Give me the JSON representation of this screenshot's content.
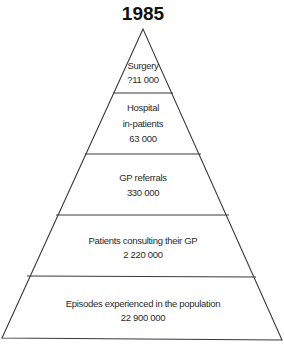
{
  "title": "1985",
  "pyramid": {
    "levels": [
      {
        "lines": [
          "Surgery",
          "?11 000"
        ],
        "label": "Surgery",
        "value": "?11 000"
      },
      {
        "lines": [
          "Hospital",
          "in-patients",
          "63 000"
        ],
        "label": "Hospital in-patients",
        "value": "63 000"
      },
      {
        "lines": [
          "GP referrals",
          "330 000"
        ],
        "label": "GP referrals",
        "value": "330 000"
      },
      {
        "lines": [
          "Patients consulting their GP",
          "2 220 000"
        ],
        "label": "Patients consulting their GP",
        "value": "2 220 000"
      },
      {
        "lines": [
          "Episodes experienced in the population",
          "22 900 000"
        ],
        "label": "Episodes experienced in the population",
        "value": "22 900 000"
      }
    ]
  },
  "colors": {
    "stroke": "#3a3a3a",
    "text": "#2a2a2a",
    "background": "#ffffff"
  }
}
